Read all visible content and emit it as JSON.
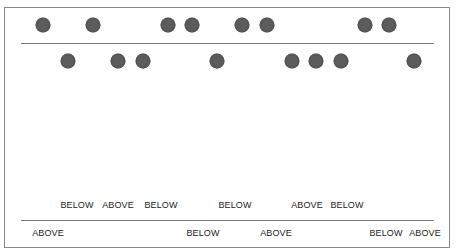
{
  "diagram": {
    "top_row_dots_x": [
      43,
      93,
      168,
      192,
      242,
      267,
      365,
      389
    ],
    "bottom_row_dots_x": [
      68,
      118,
      143,
      217,
      292,
      316,
      341,
      414
    ],
    "labels_upper": [
      {
        "text": "BELOW",
        "x": 77
      },
      {
        "text": "ABOVE",
        "x": 118
      },
      {
        "text": "BELOW",
        "x": 161
      },
      {
        "text": "BELOW",
        "x": 235
      },
      {
        "text": "ABOVE",
        "x": 307
      },
      {
        "text": "BELOW",
        "x": 347
      }
    ],
    "labels_lower": [
      {
        "text": "ABOVE",
        "x": 48
      },
      {
        "text": "BELOW",
        "x": 203
      },
      {
        "text": "ABOVE",
        "x": 276
      },
      {
        "text": "BELOW",
        "x": 386
      },
      {
        "text": "ABOVE",
        "x": 425
      }
    ],
    "colors": {
      "dot": "#5c5c5c",
      "line": "#7a7a7a",
      "frame": "#8a8a8a",
      "text": "#222222"
    }
  }
}
